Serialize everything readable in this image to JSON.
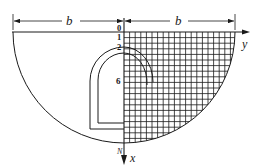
{
  "diagram": {
    "dimension_left_label": "b",
    "dimension_right_label": "b",
    "axis_y_label": "y",
    "axis_x_label": "x",
    "point_N_label": "N",
    "depth_labels": [
      "0",
      "1",
      "2",
      "6"
    ],
    "colors": {
      "stroke": "#1a1a1a",
      "background": "#ffffff"
    }
  }
}
